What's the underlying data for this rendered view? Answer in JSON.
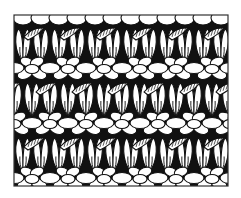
{
  "diagram": {
    "colors": {
      "background": "#ffffff",
      "ink": "#111111",
      "stitch_fill": "#ffffff",
      "frame": "#333333"
    },
    "frame": {
      "x": 14,
      "y": 15,
      "width": 214,
      "height": 171
    },
    "purl_bands": [
      {
        "cy": 18,
        "type": "half"
      },
      {
        "cy": 68,
        "type": "full"
      },
      {
        "cy": 123,
        "type": "full"
      },
      {
        "cy": 178,
        "type": "full"
      }
    ],
    "knit_rows": [
      {
        "top": 26,
        "bottom": 62
      },
      {
        "top": 80,
        "bottom": 116
      },
      {
        "top": 135,
        "bottom": 172
      }
    ],
    "twist_rows": [
      {
        "cy": 33
      },
      {
        "cy": 88
      },
      {
        "cy": 143
      }
    ],
    "column_pitch": 18,
    "cluster_pitch": 36
  }
}
